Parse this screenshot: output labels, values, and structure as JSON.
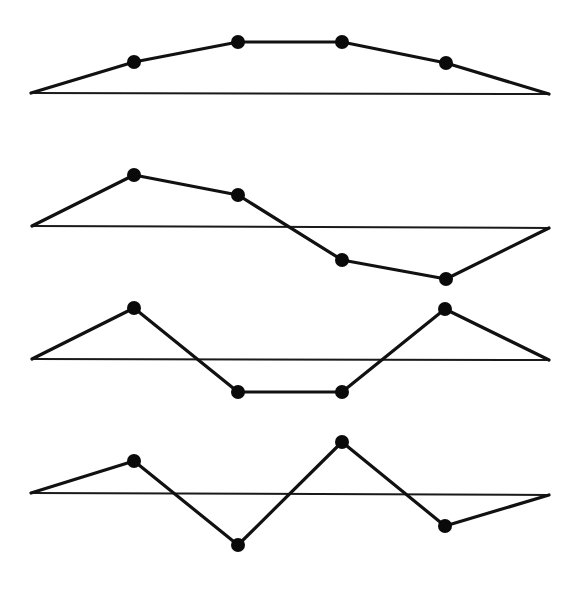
{
  "diagram": {
    "colors": {
      "line": "#111111",
      "baseline": "#1a1a1a",
      "dot": "#0a0a0a",
      "background": "#ffffff"
    },
    "dot_radius": 7,
    "panels": [
      {
        "name": "mode-1",
        "baseline": {
          "x1": 31,
          "y1": 93,
          "x2": 549,
          "y2": 94
        },
        "points": [
          [
            31,
            93
          ],
          [
            134,
            62
          ],
          [
            238,
            42
          ],
          [
            342,
            42
          ],
          [
            446,
            63
          ],
          [
            549,
            94
          ]
        ],
        "masses": [
          [
            134,
            62
          ],
          [
            238,
            42
          ],
          [
            342,
            42
          ],
          [
            446,
            63
          ]
        ]
      },
      {
        "name": "mode-2",
        "baseline": {
          "x1": 32,
          "y1": 226,
          "x2": 549,
          "y2": 228
        },
        "points": [
          [
            32,
            226
          ],
          [
            134,
            175
          ],
          [
            238,
            195
          ],
          [
            342,
            260
          ],
          [
            446,
            279
          ],
          [
            549,
            228
          ]
        ],
        "masses": [
          [
            134,
            175
          ],
          [
            238,
            195
          ],
          [
            342,
            260
          ],
          [
            446,
            279
          ]
        ]
      },
      {
        "name": "mode-3",
        "baseline": {
          "x1": 32,
          "y1": 359,
          "x2": 549,
          "y2": 360
        },
        "points": [
          [
            32,
            359
          ],
          [
            134,
            308
          ],
          [
            238,
            392
          ],
          [
            342,
            392
          ],
          [
            445,
            309
          ],
          [
            549,
            360
          ]
        ],
        "masses": [
          [
            134,
            308
          ],
          [
            238,
            392
          ],
          [
            342,
            392
          ],
          [
            445,
            309
          ]
        ]
      },
      {
        "name": "mode-4",
        "baseline": {
          "x1": 31,
          "y1": 493,
          "x2": 549,
          "y2": 495
        },
        "points": [
          [
            31,
            493
          ],
          [
            134,
            461
          ],
          [
            238,
            545
          ],
          [
            342,
            442
          ],
          [
            445,
            526
          ],
          [
            549,
            495
          ]
        ],
        "masses": [
          [
            134,
            461
          ],
          [
            238,
            545
          ],
          [
            342,
            442
          ],
          [
            445,
            526
          ]
        ]
      }
    ]
  }
}
